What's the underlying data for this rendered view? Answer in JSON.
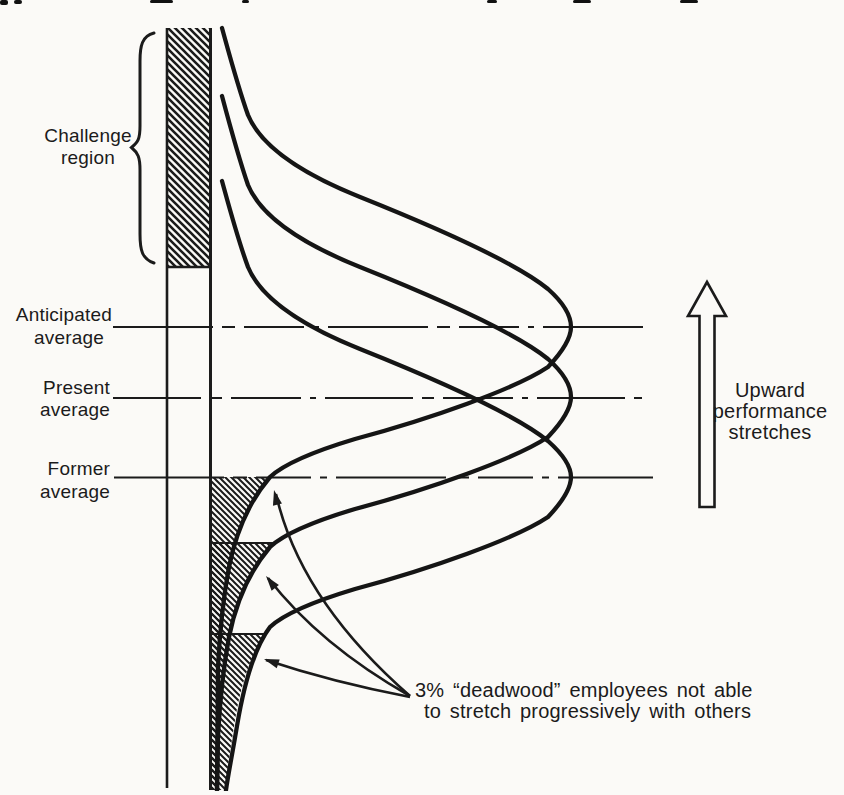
{
  "figure": {
    "type": "performance-distribution-diagram",
    "colors": {
      "ink": "#1b1b1b",
      "paper": "#fbfaf7"
    },
    "labels": {
      "challenge": {
        "line1": "Challenge",
        "line2": "region"
      },
      "anticipated": {
        "line1": "Anticipated",
        "line2": "average"
      },
      "present": {
        "line1": "Present",
        "line2": "average"
      },
      "former": {
        "line1": "Former",
        "line2": "average"
      },
      "upward": {
        "line1": "Upward",
        "line2": "performance",
        "line3": "stretches"
      },
      "deadwood": {
        "line1": "3% “deadwood” employees not able",
        "line2": "to stretch progressively with others"
      }
    },
    "reference_lines": [
      {
        "name": "anticipated-average",
        "label": "Anticipated average"
      },
      {
        "name": "present-average",
        "label": "Present average"
      },
      {
        "name": "former-average",
        "label": "Former average"
      }
    ],
    "curves": [
      {
        "name": "anticipated-distribution",
        "peak_at": "Anticipated average"
      },
      {
        "name": "present-distribution",
        "peak_at": "Present average"
      },
      {
        "name": "former-distribution",
        "peak_at": "Former average"
      }
    ],
    "hatched_regions": [
      {
        "name": "challenge-region",
        "label": "Challenge region"
      },
      {
        "name": "deadwood-tail-1",
        "label": "3% deadwood (anticipated curve)"
      },
      {
        "name": "deadwood-tail-2",
        "label": "3% deadwood (present curve)"
      },
      {
        "name": "deadwood-tail-3",
        "label": "3% deadwood (former curve)"
      }
    ]
  }
}
